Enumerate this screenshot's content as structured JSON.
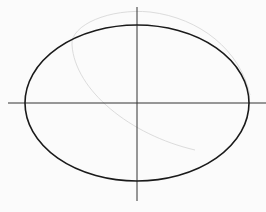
{
  "diagram": {
    "colors": {
      "background": "#fbfbfb",
      "ellipse": "#1a1a1a",
      "axis": "#333333",
      "faint_arc": "#d8d8d8"
    },
    "ellipse": {
      "cx": 137,
      "cy": 103,
      "rx": 112,
      "ry": 78
    },
    "axes": {
      "x": {
        "x1": 8,
        "x2": 266,
        "y": 103
      },
      "y": {
        "x": 137,
        "y1": 7,
        "y2": 201
      }
    }
  }
}
